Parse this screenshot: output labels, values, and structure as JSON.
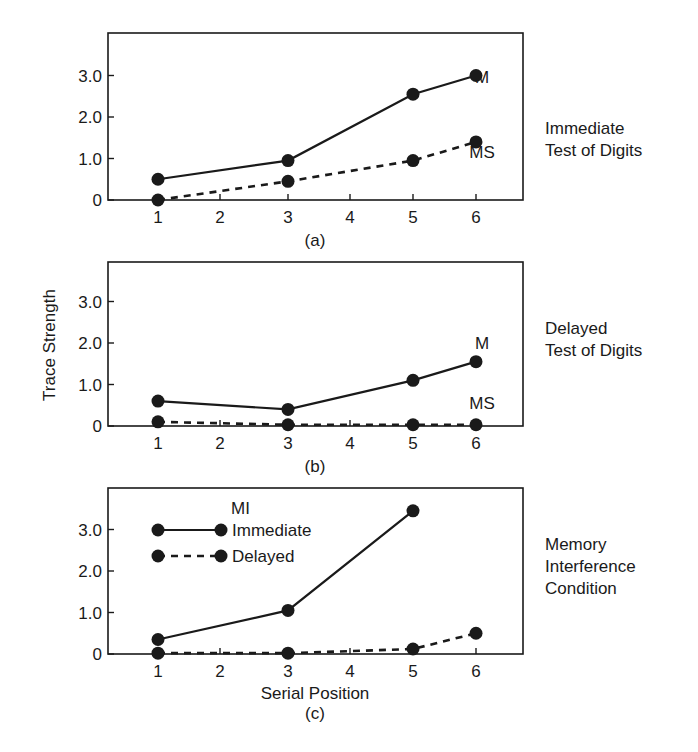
{
  "chart_data": [
    {
      "type": "line",
      "panel": "(a)",
      "title": "Immediate Test of Digits",
      "xlabel": "",
      "ylabel": "Trace Strength",
      "x": [
        1,
        3,
        5,
        6
      ],
      "x_ticks": [
        "1",
        "2",
        "3",
        "4",
        "5",
        "6"
      ],
      "y_ticks": [
        "0",
        "1.0",
        "2.0",
        "3.0"
      ],
      "ylim": [
        0,
        3.8
      ],
      "grid": false,
      "series": [
        {
          "name": "M",
          "style": "solid",
          "values": [
            0.5,
            0.95,
            2.55,
            3.0
          ]
        },
        {
          "name": "MS",
          "style": "dashed",
          "values": [
            0.0,
            0.45,
            0.95,
            1.4
          ]
        }
      ]
    },
    {
      "type": "line",
      "panel": "(b)",
      "title": "Delayed Test of Digits",
      "xlabel": "",
      "ylabel": "Trace Strength",
      "x": [
        1,
        3,
        5,
        6
      ],
      "x_ticks": [
        "1",
        "2",
        "3",
        "4",
        "5",
        "6"
      ],
      "y_ticks": [
        "0",
        "1.0",
        "2.0",
        "3.0"
      ],
      "ylim": [
        0,
        3.8
      ],
      "grid": false,
      "series": [
        {
          "name": "M",
          "style": "solid",
          "values": [
            0.6,
            0.4,
            1.1,
            1.55
          ]
        },
        {
          "name": "MS",
          "style": "dashed",
          "values": [
            0.1,
            0.03,
            0.03,
            0.03
          ]
        }
      ]
    },
    {
      "type": "line",
      "panel": "(c)",
      "title": "Memory Interference Condition",
      "xlabel": "Serial Position",
      "ylabel": "Trace Strength",
      "x_ticks": [
        "1",
        "2",
        "3",
        "4",
        "5",
        "6"
      ],
      "y_ticks": [
        "0",
        "1.0",
        "2.0",
        "3.0"
      ],
      "ylim": [
        0,
        3.8
      ],
      "grid": false,
      "legend": {
        "title": "MI",
        "position": "upper left",
        "entries": [
          "Immediate",
          "Delayed"
        ]
      },
      "series": [
        {
          "name": "Immediate",
          "style": "solid",
          "x": [
            1,
            3,
            5
          ],
          "values": [
            0.35,
            1.05,
            3.45
          ]
        },
        {
          "name": "Delayed",
          "style": "dashed",
          "x": [
            1,
            3,
            5,
            6
          ],
          "values": [
            0.02,
            0.02,
            0.12,
            0.5
          ]
        }
      ]
    }
  ],
  "panels": {
    "a": {
      "caption": "(a)",
      "side_title": "Immediate\nTest of Digits",
      "tag_m": "M",
      "tag_ms": "MS"
    },
    "b": {
      "caption": "(b)",
      "side_title": "Delayed\nTest of Digits",
      "tag_m": "M",
      "tag_ms": "MS"
    },
    "c": {
      "caption": "(c)",
      "side_title": "Memory\nInterference\nCondition",
      "xlabel": "Serial Position",
      "legend_title": "MI",
      "legend_immediate": "Immediate",
      "legend_delayed": "Delayed"
    }
  },
  "ylabel": "Trace Strength",
  "x_ticks": [
    "1",
    "2",
    "3",
    "4",
    "5",
    "6"
  ],
  "y_ticks": [
    "0",
    "1.0",
    "2.0",
    "3.0"
  ]
}
